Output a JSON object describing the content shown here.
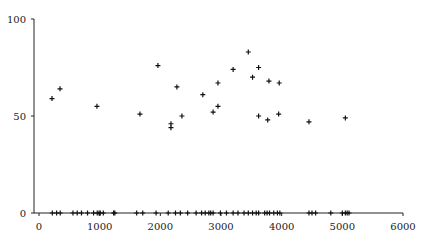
{
  "chart_data": {
    "type": "scatter",
    "title": "",
    "xlabel": "",
    "ylabel": "",
    "xlim": [
      0,
      6000
    ],
    "ylim": [
      0,
      100
    ],
    "x_ticks": [
      "0",
      "1000",
      "2000",
      "3000",
      "4000",
      "5000",
      "6000"
    ],
    "y_ticks": [
      "0",
      "50",
      "100"
    ],
    "grid": false,
    "legend": null,
    "series": [
      {
        "name": "points",
        "marker": "+",
        "points": [
          [
            214,
            59
          ],
          [
            346,
            64
          ],
          [
            955,
            55
          ],
          [
            1664,
            51
          ],
          [
            1960,
            76
          ],
          [
            2175,
            46
          ],
          [
            2175,
            44
          ],
          [
            2273,
            65
          ],
          [
            2356,
            50
          ],
          [
            2700,
            61
          ],
          [
            2870,
            52
          ],
          [
            2950,
            55
          ],
          [
            2950,
            67
          ],
          [
            3200,
            74
          ],
          [
            3450,
            83
          ],
          [
            3520,
            70
          ],
          [
            3620,
            75
          ],
          [
            3620,
            50
          ],
          [
            3770,
            48
          ],
          [
            3790,
            68
          ],
          [
            3950,
            51
          ],
          [
            3960,
            67
          ],
          [
            4450,
            47
          ],
          [
            5050,
            49
          ],
          [
            220,
            0
          ],
          [
            290,
            0
          ],
          [
            350,
            0
          ],
          [
            560,
            0
          ],
          [
            630,
            0
          ],
          [
            700,
            0
          ],
          [
            800,
            0
          ],
          [
            900,
            0
          ],
          [
            960,
            0
          ],
          [
            990,
            0
          ],
          [
            1010,
            0
          ],
          [
            1060,
            0
          ],
          [
            1230,
            0
          ],
          [
            1250,
            0
          ],
          [
            1610,
            0
          ],
          [
            1710,
            0
          ],
          [
            1930,
            0
          ],
          [
            2130,
            0
          ],
          [
            2250,
            0
          ],
          [
            2330,
            0
          ],
          [
            2450,
            0
          ],
          [
            2590,
            0
          ],
          [
            2680,
            0
          ],
          [
            2740,
            0
          ],
          [
            2800,
            0
          ],
          [
            2830,
            0
          ],
          [
            2870,
            0
          ],
          [
            2990,
            0
          ],
          [
            3090,
            0
          ],
          [
            3200,
            0
          ],
          [
            3280,
            0
          ],
          [
            3380,
            0
          ],
          [
            3450,
            0
          ],
          [
            3520,
            0
          ],
          [
            3580,
            0
          ],
          [
            3620,
            0
          ],
          [
            3720,
            0
          ],
          [
            3760,
            0
          ],
          [
            3800,
            0
          ],
          [
            3870,
            0
          ],
          [
            3930,
            0
          ],
          [
            3970,
            0
          ],
          [
            4450,
            0
          ],
          [
            4500,
            0
          ],
          [
            4560,
            0
          ],
          [
            4810,
            0
          ],
          [
            5000,
            0
          ],
          [
            5050,
            0
          ],
          [
            5080,
            0
          ],
          [
            5110,
            0
          ]
        ]
      }
    ]
  }
}
